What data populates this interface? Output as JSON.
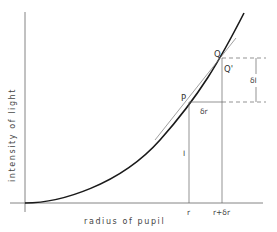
{
  "figure": {
    "type": "diagram"
  },
  "axes": {
    "xlabel": "radius of pupil",
    "ylabel": "intensity of light"
  },
  "points": {
    "P": "P",
    "Q": "Q",
    "Q_prime": "Q'"
  },
  "ticks": {
    "r": "r",
    "r_plus_dr": "r+δr"
  },
  "annotations": {
    "delta_r": "δr",
    "delta_I": "δI",
    "I": "I"
  },
  "colors": {
    "curve": "#1a1a1a",
    "tangent": "#555555",
    "guides": "#666666",
    "axis": "#555555"
  }
}
